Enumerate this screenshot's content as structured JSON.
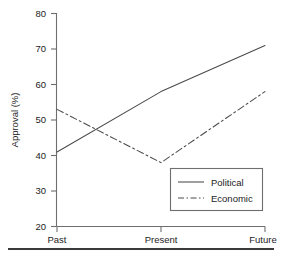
{
  "chart_data": {
    "type": "line",
    "title": "",
    "xlabel": "",
    "ylabel": "Approval (%)",
    "categories": [
      "Past",
      "Present",
      "Future"
    ],
    "ylim": [
      20,
      80
    ],
    "yticks": [
      20,
      30,
      40,
      50,
      60,
      70,
      80
    ],
    "ytick_labels": [
      "20",
      "30",
      "40",
      "50",
      "60",
      "70",
      "80"
    ],
    "grid": false,
    "legend_position": "lower-right",
    "series": [
      {
        "name": "Political",
        "values": [
          41,
          58,
          71
        ],
        "linestyle": "solid",
        "color": "#4a4a4a"
      },
      {
        "name": "Economic",
        "values": [
          53,
          38,
          58
        ],
        "linestyle": "dashdot",
        "color": "#4a4a4a"
      }
    ]
  },
  "axis": {
    "y_title": "Approval (%)",
    "y_tick_0": "20",
    "y_tick_1": "30",
    "y_tick_2": "40",
    "y_tick_3": "50",
    "y_tick_4": "60",
    "y_tick_5": "70",
    "y_tick_6": "80",
    "x_tick_0": "Past",
    "x_tick_1": "Present",
    "x_tick_2": "Future"
  },
  "legend": {
    "entry_0": "Political",
    "entry_1": "Economic"
  }
}
